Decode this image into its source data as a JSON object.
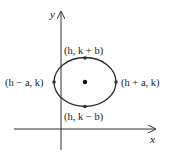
{
  "figure": {
    "type": "ellipse-with-center-and-vertices",
    "axes": {
      "x_label": "x",
      "y_label": "y"
    },
    "center": {
      "label": "(h, k)"
    },
    "points": {
      "top": {
        "label": "(h, k + b)"
      },
      "bottom": {
        "label": "(h, k − b)"
      },
      "left": {
        "label": "(h − a, k)"
      },
      "right": {
        "label": "(h + a, k)"
      }
    },
    "colors": {
      "stroke": "#222222",
      "background": "#ffffff"
    }
  }
}
